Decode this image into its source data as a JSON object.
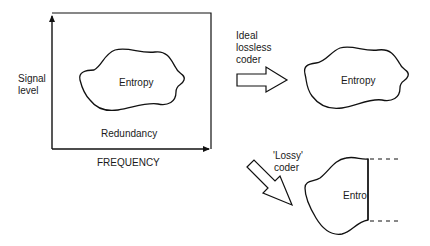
{
  "axes": {
    "y_label_line1": "Signal",
    "y_label_line2": "level",
    "x_label": "FREQUENCY"
  },
  "original": {
    "region_label": "Entropy",
    "outer_label": "Redundancy"
  },
  "lossless": {
    "arrow_label_line1": "Ideal",
    "arrow_label_line2": "lossless",
    "arrow_label_line3": "coder",
    "region_label": "Entropy"
  },
  "lossy": {
    "arrow_label_line1": "'Lossy'",
    "arrow_label_line2": "coder",
    "region_label": "Entro"
  },
  "colors": {
    "stroke": "#111111",
    "background": "#ffffff"
  }
}
